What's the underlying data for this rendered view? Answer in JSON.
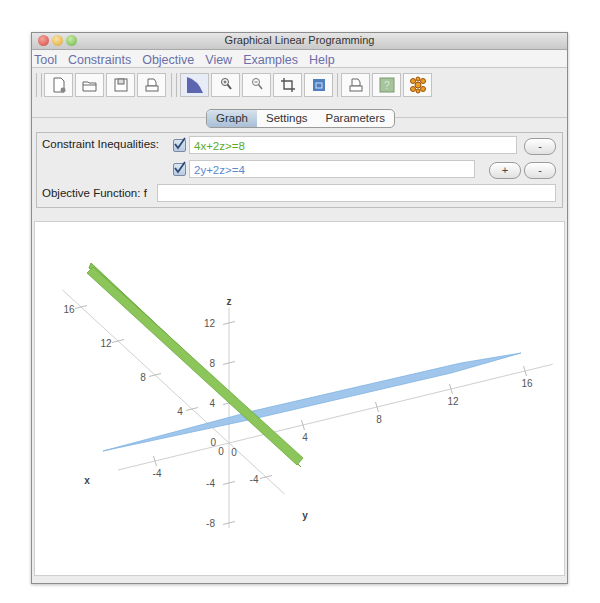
{
  "window": {
    "title": "Graphical Linear Programming"
  },
  "menu": [
    "Tool",
    "Constraints",
    "Objective",
    "View",
    "Examples",
    "Help"
  ],
  "toolbar": {
    "group1": [
      "new-file-icon",
      "open-folder-icon",
      "save-disk-icon",
      "print-icon"
    ],
    "group2": [
      "feasible-region-icon",
      "zoom-in-icon",
      "zoom-out-icon",
      "crop-icon",
      "fit-window-icon"
    ],
    "group3": [
      "print-graph-icon",
      "help-icon",
      "molecule-icon"
    ]
  },
  "tabs": [
    {
      "label": "Graph",
      "active": true
    },
    {
      "label": "Settings",
      "active": false
    },
    {
      "label": "Parameters",
      "active": false
    }
  ],
  "constraints": {
    "label": "Constraint Inequalities:",
    "items": [
      {
        "checked": true,
        "value": "4x+2z>=8",
        "color": "#5aaa2c"
      },
      {
        "checked": true,
        "value": "2y+2z>=4",
        "color": "#5a8ad0"
      }
    ],
    "add_label": "+",
    "remove_label": "-"
  },
  "objective": {
    "label": "Objective Function: f",
    "value": ""
  },
  "chart_data": {
    "type": "3d-surface",
    "axes": {
      "x": {
        "label": "x",
        "ticks": [
          -4,
          0,
          4,
          8,
          12,
          16
        ]
      },
      "y": {
        "label": "y",
        "ticks": [
          -4,
          0,
          4,
          8,
          12,
          16
        ]
      },
      "z": {
        "label": "z",
        "ticks": [
          -8,
          -4,
          0,
          4,
          8,
          12
        ]
      }
    },
    "planes": [
      {
        "equation": "4x+2z=8",
        "color": "#8cc65a"
      },
      {
        "equation": "2y+2z=4",
        "color": "#9cc4ec"
      }
    ]
  }
}
